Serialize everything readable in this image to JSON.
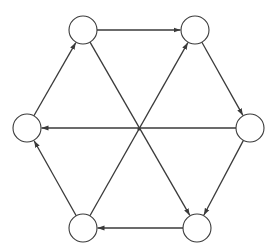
{
  "diagram": {
    "type": "directed-graph",
    "colors": {
      "stroke": "#3a3a3a",
      "node_fill": "#ffffff",
      "background": "#ffffff"
    },
    "node_radius": 14,
    "center_point": {
      "x": 139,
      "y": 129
    },
    "nodes": [
      {
        "id": "top-left",
        "x": 83,
        "y": 30
      },
      {
        "id": "top-right",
        "x": 195,
        "y": 30
      },
      {
        "id": "right",
        "x": 250,
        "y": 128
      },
      {
        "id": "bottom-right",
        "x": 197,
        "y": 228
      },
      {
        "id": "bottom-left",
        "x": 83,
        "y": 228
      },
      {
        "id": "left",
        "x": 27,
        "y": 128
      }
    ],
    "edges": [
      {
        "from": "top-left",
        "to": "top-right"
      },
      {
        "from": "top-right",
        "to": "right"
      },
      {
        "from": "right",
        "to": "bottom-right"
      },
      {
        "from": "bottom-right",
        "to": "bottom-left"
      },
      {
        "from": "bottom-left",
        "to": "left"
      },
      {
        "from": "left",
        "to": "top-left"
      },
      {
        "from": "top-left",
        "to": "bottom-right"
      },
      {
        "from": "bottom-left",
        "to": "top-right"
      },
      {
        "from": "right",
        "to": "left"
      }
    ]
  }
}
